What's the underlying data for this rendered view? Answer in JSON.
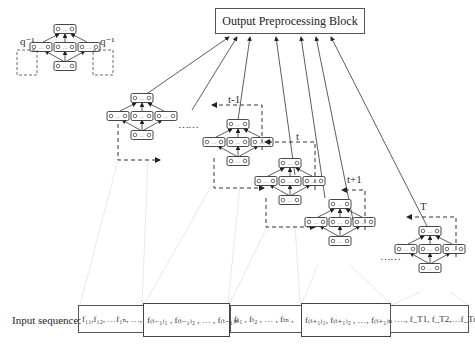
{
  "output_block": {
    "label": "Output Preprocessing Block"
  },
  "recurrence_legend": {
    "left_label": "q⁻¹",
    "right_label": "q⁻¹"
  },
  "time_labels": {
    "t_minus_1": "t-1",
    "t": "t",
    "t_plus_1": "t+1",
    "T": "T"
  },
  "ellipsis": {
    "between_first_and_t_minus_1": "……",
    "between_t_plus_1_and_T": "……"
  },
  "input_sequence": {
    "label": "Input sequence:",
    "segments": [
      {
        "text": "f₁₁,f₁₂, …f₁ₙ, …,"
      },
      {
        "text": "f₍ₜ₋₁₎₁ , f₍ₜ₋₁₎₂ , … , f₍ₜ₋₁₎ₙ"
      },
      {
        "text": "fₜ₁ , fₜ₂ , … , fₜₙ ,"
      },
      {
        "text": "f₍ₜ₊₁₎₁, f₍ₜ₊₁₎₂ , …, f₍ₜ₊₁₎ₙ"
      },
      {
        "text": "…., f_T1, f_T2,…f_Tn"
      }
    ]
  },
  "node_glyph": "0 … 0",
  "colors": {
    "line": "#333333",
    "dashed": "#333333",
    "faint": "#cccccc"
  }
}
